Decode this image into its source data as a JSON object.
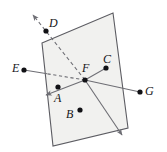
{
  "figure": {
    "type": "geometry-diagram",
    "canvas": {
      "width": 167,
      "height": 152
    },
    "colors": {
      "background": "#ffffff",
      "plane_fill": "#f1f1ef",
      "plane_stroke": "#5c5c62",
      "line_stroke": "#6e6e74",
      "dashed_stroke": "#6e6e74",
      "point_fill": "#111115",
      "label_color": "#16161a"
    },
    "plane": {
      "name": "parallelogram-plane",
      "corners": [
        {
          "x": 42,
          "y": 43
        },
        {
          "x": 113,
          "y": 13
        },
        {
          "x": 128,
          "y": 128
        },
        {
          "x": 53,
          "y": 146
        }
      ]
    },
    "points": [
      {
        "id": "A",
        "label": "A",
        "dot_x": 58,
        "dot_y": 87,
        "label_x": 54,
        "label_y": 92
      },
      {
        "id": "B",
        "label": "B",
        "dot_x": 80,
        "dot_y": 110,
        "label_x": 66,
        "label_y": 108
      },
      {
        "id": "C",
        "label": "C",
        "dot_x": 106,
        "dot_y": 68,
        "label_x": 103,
        "label_y": 53
      },
      {
        "id": "D",
        "label": "D",
        "dot_x": 46,
        "dot_y": 31,
        "label_x": 49,
        "label_y": 17
      },
      {
        "id": "E",
        "label": "E",
        "dot_x": 24,
        "dot_y": 70,
        "label_x": 12,
        "label_y": 62
      },
      {
        "id": "F",
        "label": "F",
        "dot_x": 85,
        "dot_y": 80,
        "label_x": 82,
        "label_y": 62
      },
      {
        "id": "G",
        "label": "G",
        "dot_x": 140,
        "dot_y": 92,
        "label_x": 145,
        "label_y": 85
      }
    ],
    "lines": [
      {
        "name": "ray-F-to-D-arrow",
        "style": "dashed",
        "x1": 85,
        "y1": 80,
        "x2": 33,
        "y2": 15,
        "arrow": "end"
      },
      {
        "name": "ray-F-to-E",
        "style": "mixed",
        "x1": 85,
        "y1": 80,
        "x2": 24,
        "y2": 70,
        "arrow": "none"
      },
      {
        "name": "ray-F-to-A-arrow",
        "style": "solid",
        "x1": 85,
        "y1": 80,
        "x2": 46,
        "y2": 95,
        "arrow": "end"
      },
      {
        "name": "line-F-to-C",
        "style": "solid",
        "x1": 85,
        "y1": 80,
        "x2": 106,
        "y2": 68,
        "arrow": "none"
      },
      {
        "name": "line-F-to-G",
        "style": "solid",
        "x1": 85,
        "y1": 80,
        "x2": 140,
        "y2": 92,
        "arrow": "none"
      },
      {
        "name": "ray-F-down-arrow",
        "style": "solid",
        "x1": 85,
        "y1": 80,
        "x2": 122,
        "y2": 135,
        "arrow": "end"
      }
    ]
  }
}
